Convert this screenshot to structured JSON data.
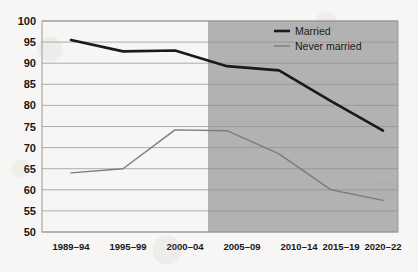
{
  "chart_data": {
    "type": "line",
    "title": "",
    "xlabel": "",
    "ylabel": "",
    "categories": [
      "1989–94",
      "1995–99",
      "2000–04",
      "2005–09",
      "2010–14",
      "2015–19",
      "2020–22"
    ],
    "ylim": [
      50,
      100
    ],
    "yticks": [
      50,
      55,
      60,
      65,
      70,
      75,
      80,
      85,
      90,
      95,
      100
    ],
    "grid": true,
    "legend_position": "top-right",
    "series": [
      {
        "name": "Married",
        "color": "#1a1a1a",
        "values": [
          95.5,
          92.8,
          93.0,
          89.3,
          88.3,
          81.0,
          74.0
        ]
      },
      {
        "name": "Never married",
        "color": "#7c7c7c",
        "values": [
          64.0,
          65.0,
          74.2,
          74.0,
          68.5,
          60.0,
          57.5
        ]
      }
    ],
    "shaded_region": {
      "from_category": "2005–09",
      "to_category": "2020–22",
      "color": "#b2b2b2"
    }
  },
  "axis": {
    "y_labels": [
      "100",
      "95",
      "90",
      "85",
      "80",
      "75",
      "70",
      "65",
      "60",
      "55",
      "50"
    ],
    "x_labels": [
      "1989–94",
      "1995–99",
      "2000–04",
      "2005–09",
      "2010–14",
      "2015–19",
      "2020–22"
    ]
  },
  "legend": {
    "items": [
      {
        "label": "Married",
        "swatch": "thick-black-line"
      },
      {
        "label": "Never married",
        "swatch": "thin-gray-line"
      }
    ]
  }
}
